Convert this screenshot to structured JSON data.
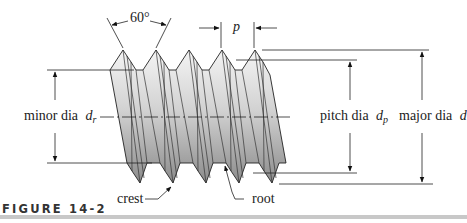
{
  "figure": {
    "caption": "FIGURE 14-2",
    "thread_angle": "60°",
    "pitch_symbol": "p",
    "labels": {
      "minor_dia": "minor dia",
      "minor_sym": "d",
      "minor_sub": "r",
      "pitch_dia": "pitch dia",
      "pitch_sym": "d",
      "pitch_sub": "p",
      "major_dia": "major dia",
      "major_sym": "d",
      "crest": "crest",
      "root": "root"
    },
    "colors": {
      "line": "#1a1a1a",
      "thread_light": "#f2f2f2",
      "thread_dark": "#8a8a8a",
      "caption_bar": "#c8c8c8"
    }
  }
}
